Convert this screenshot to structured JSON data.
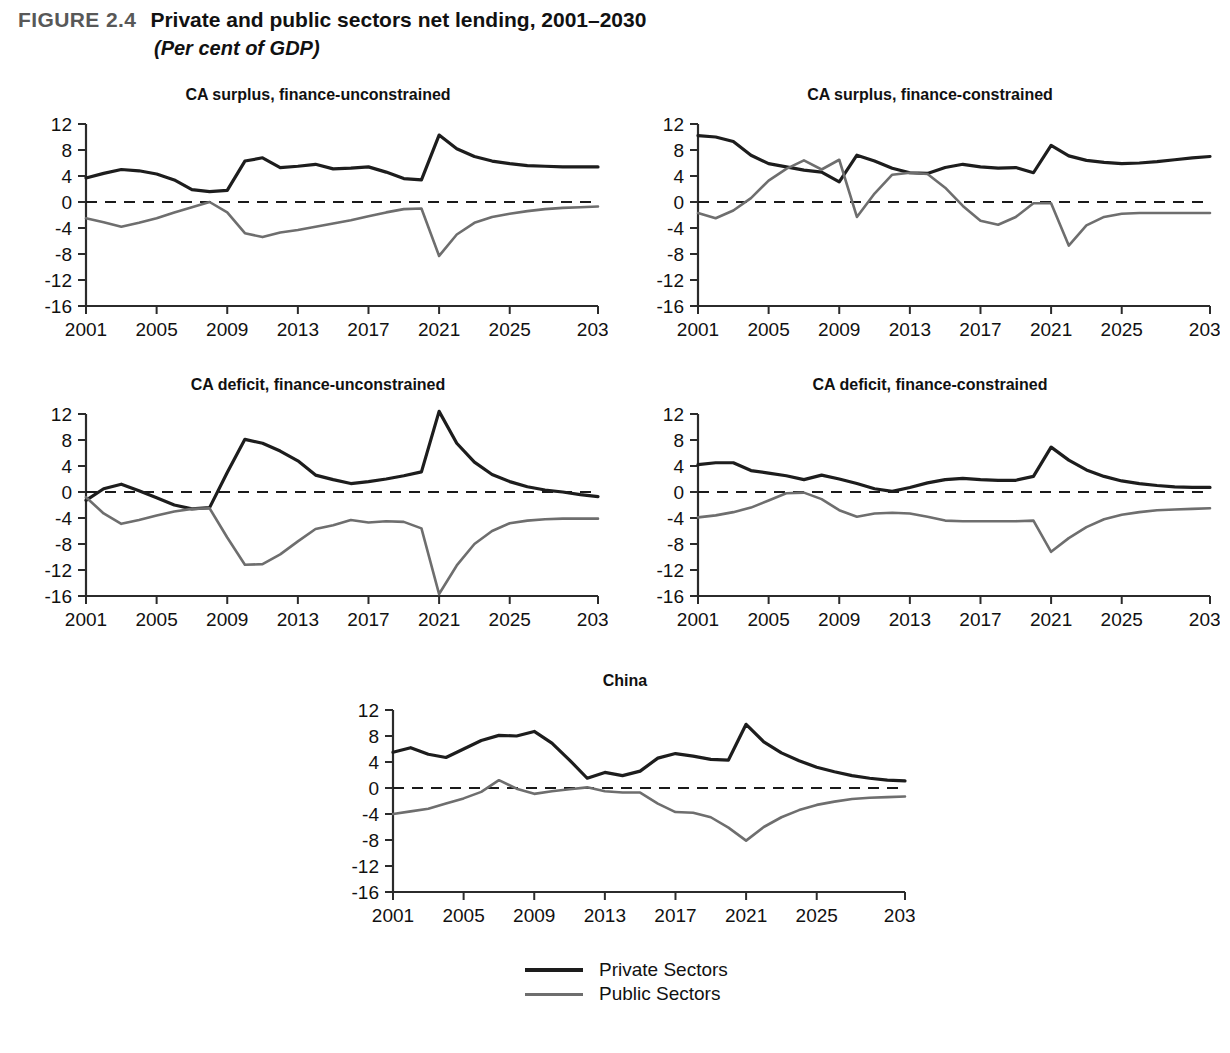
{
  "figure": {
    "label": "FIGURE 2.4",
    "title": "Private and public sectors net lending, 2001–2030",
    "subtitle": "(Per cent of GDP)"
  },
  "legend": {
    "position": "bottom-center",
    "entries": [
      {
        "label": "Private Sectors",
        "color": "#1d1d1d"
      },
      {
        "label": "Public Sectors",
        "color": "#6e6e6e"
      }
    ]
  },
  "axes_common": {
    "ylim": [
      -16,
      12
    ],
    "yticks": [
      12,
      8,
      4,
      0,
      -4,
      -8,
      -12,
      -16
    ],
    "ytick_labels": [
      "12",
      "8",
      "4",
      "0",
      "-4",
      "-8",
      "-12",
      "-16"
    ],
    "xlim": [
      2001,
      2030
    ],
    "xticks": [
      2001,
      2005,
      2009,
      2013,
      2017,
      2021,
      2025,
      2030
    ],
    "xtick_labels": [
      "2001",
      "2005",
      "2009",
      "2013",
      "2017",
      "2021",
      "2025",
      "2030"
    ],
    "grid": false,
    "zero_reference_line": true
  },
  "chart_data": [
    {
      "id": "ca-surplus-finance-unconstrained",
      "type": "line",
      "title": "CA surplus, finance-unconstrained",
      "xlabel": "",
      "ylabel": "",
      "ylim": [
        -16,
        12
      ],
      "xlim": [
        2001,
        2030
      ],
      "x": [
        2001,
        2002,
        2003,
        2004,
        2005,
        2006,
        2007,
        2008,
        2009,
        2010,
        2011,
        2012,
        2013,
        2014,
        2015,
        2016,
        2017,
        2018,
        2019,
        2020,
        2021,
        2022,
        2023,
        2024,
        2025,
        2026,
        2027,
        2028,
        2029,
        2030
      ],
      "series": [
        {
          "name": "Private Sectors",
          "color": "#1d1d1d",
          "values": [
            3.7,
            4.4,
            5.0,
            4.8,
            4.3,
            3.4,
            1.9,
            1.6,
            1.8,
            6.3,
            6.8,
            5.3,
            5.5,
            5.8,
            5.1,
            5.2,
            5.4,
            4.6,
            3.6,
            3.4,
            10.3,
            8.2,
            7.0,
            6.3,
            5.9,
            5.6,
            5.5,
            5.4,
            5.4,
            5.4
          ]
        },
        {
          "name": "Public Sectors",
          "color": "#6e6e6e",
          "values": [
            -2.5,
            -3.1,
            -3.8,
            -3.2,
            -2.5,
            -1.6,
            -0.8,
            0.0,
            -1.6,
            -4.8,
            -5.4,
            -4.7,
            -4.3,
            -3.8,
            -3.3,
            -2.8,
            -2.2,
            -1.6,
            -1.1,
            -1.0,
            -8.3,
            -5.0,
            -3.2,
            -2.3,
            -1.8,
            -1.4,
            -1.1,
            -0.9,
            -0.8,
            -0.7
          ]
        }
      ]
    },
    {
      "id": "ca-surplus-finance-constrained",
      "type": "line",
      "title": "CA surplus, finance-constrained",
      "xlabel": "",
      "ylabel": "",
      "ylim": [
        -16,
        12
      ],
      "xlim": [
        2001,
        2030
      ],
      "x": [
        2001,
        2002,
        2003,
        2004,
        2005,
        2006,
        2007,
        2008,
        2009,
        2010,
        2011,
        2012,
        2013,
        2014,
        2015,
        2016,
        2017,
        2018,
        2019,
        2020,
        2021,
        2022,
        2023,
        2024,
        2025,
        2026,
        2027,
        2028,
        2029,
        2030
      ],
      "series": [
        {
          "name": "Private Sectors",
          "color": "#1d1d1d",
          "values": [
            10.2,
            10.0,
            9.3,
            7.2,
            5.9,
            5.4,
            4.9,
            4.6,
            3.1,
            7.2,
            6.3,
            5.2,
            4.5,
            4.4,
            5.3,
            5.8,
            5.4,
            5.2,
            5.3,
            4.5,
            8.7,
            7.1,
            6.4,
            6.1,
            5.9,
            6.0,
            6.2,
            6.5,
            6.8,
            7.0
          ]
        },
        {
          "name": "Public Sectors",
          "color": "#6e6e6e",
          "values": [
            -1.7,
            -2.5,
            -1.3,
            0.6,
            3.3,
            5.1,
            6.4,
            5.0,
            6.5,
            -2.3,
            1.3,
            4.2,
            4.5,
            4.3,
            2.2,
            -0.6,
            -2.9,
            -3.5,
            -2.3,
            -0.2,
            -0.2,
            -6.7,
            -3.6,
            -2.3,
            -1.8,
            -1.7,
            -1.7,
            -1.7,
            -1.7,
            -1.7
          ]
        }
      ]
    },
    {
      "id": "ca-deficit-finance-unconstrained",
      "type": "line",
      "title": "CA deficit, finance-unconstrained",
      "xlabel": "",
      "ylabel": "",
      "ylim": [
        -16,
        12
      ],
      "xlim": [
        2001,
        2030
      ],
      "x": [
        2001,
        2002,
        2003,
        2004,
        2005,
        2006,
        2007,
        2008,
        2009,
        2010,
        2011,
        2012,
        2013,
        2014,
        2015,
        2016,
        2017,
        2018,
        2019,
        2020,
        2021,
        2022,
        2023,
        2024,
        2025,
        2026,
        2027,
        2028,
        2029,
        2030
      ],
      "series": [
        {
          "name": "Private Sectors",
          "color": "#1d1d1d",
          "values": [
            -1.3,
            0.5,
            1.2,
            0.2,
            -0.9,
            -2.0,
            -2.6,
            -2.4,
            3.0,
            8.1,
            7.5,
            6.3,
            4.8,
            2.6,
            1.9,
            1.3,
            1.6,
            2.0,
            2.5,
            3.1,
            12.4,
            7.5,
            4.6,
            2.7,
            1.6,
            0.8,
            0.3,
            0.0,
            -0.4,
            -0.7
          ]
        },
        {
          "name": "Public Sectors",
          "color": "#6e6e6e",
          "values": [
            -0.8,
            -3.3,
            -4.9,
            -4.3,
            -3.6,
            -3.0,
            -2.6,
            -2.5,
            -7.0,
            -11.2,
            -11.1,
            -9.6,
            -7.6,
            -5.7,
            -5.1,
            -4.3,
            -4.7,
            -4.5,
            -4.6,
            -5.6,
            -15.7,
            -11.3,
            -8.0,
            -6.0,
            -4.8,
            -4.4,
            -4.2,
            -4.1,
            -4.1,
            -4.1
          ]
        }
      ]
    },
    {
      "id": "ca-deficit-finance-constrained",
      "type": "line",
      "title": "CA deficit, finance-constrained",
      "xlabel": "",
      "ylabel": "",
      "ylim": [
        -16,
        12
      ],
      "xlim": [
        2001,
        2030
      ],
      "x": [
        2001,
        2002,
        2003,
        2004,
        2005,
        2006,
        2007,
        2008,
        2009,
        2010,
        2011,
        2012,
        2013,
        2014,
        2015,
        2016,
        2017,
        2018,
        2019,
        2020,
        2021,
        2022,
        2023,
        2024,
        2025,
        2026,
        2027,
        2028,
        2029,
        2030
      ],
      "series": [
        {
          "name": "Private Sectors",
          "color": "#1d1d1d",
          "values": [
            4.2,
            4.5,
            4.5,
            3.3,
            2.9,
            2.5,
            1.9,
            2.6,
            2.0,
            1.3,
            0.5,
            0.1,
            0.7,
            1.4,
            1.9,
            2.1,
            1.9,
            1.8,
            1.8,
            2.4,
            6.9,
            4.9,
            3.4,
            2.4,
            1.7,
            1.3,
            1.0,
            0.8,
            0.7,
            0.7
          ]
        },
        {
          "name": "Public Sectors",
          "color": "#6e6e6e",
          "values": [
            -3.9,
            -3.6,
            -3.1,
            -2.4,
            -1.3,
            -0.2,
            -0.1,
            -1.1,
            -2.8,
            -3.8,
            -3.3,
            -3.2,
            -3.3,
            -3.8,
            -4.4,
            -4.5,
            -4.5,
            -4.5,
            -4.5,
            -4.4,
            -9.2,
            -7.1,
            -5.4,
            -4.2,
            -3.5,
            -3.1,
            -2.8,
            -2.7,
            -2.6,
            -2.5
          ]
        }
      ]
    },
    {
      "id": "china",
      "type": "line",
      "title": "China",
      "xlabel": "",
      "ylabel": "",
      "ylim": [
        -16,
        12
      ],
      "xlim": [
        2001,
        2030
      ],
      "x": [
        2001,
        2002,
        2003,
        2004,
        2005,
        2006,
        2007,
        2008,
        2009,
        2010,
        2011,
        2012,
        2013,
        2014,
        2015,
        2016,
        2017,
        2018,
        2019,
        2020,
        2021,
        2022,
        2023,
        2024,
        2025,
        2026,
        2027,
        2028,
        2029,
        2030
      ],
      "series": [
        {
          "name": "Private Sectors",
          "color": "#1d1d1d",
          "values": [
            5.5,
            6.2,
            5.2,
            4.7,
            6.0,
            7.3,
            8.1,
            8.0,
            8.7,
            6.9,
            4.3,
            1.5,
            2.4,
            1.9,
            2.6,
            4.6,
            5.3,
            4.9,
            4.4,
            4.3,
            9.8,
            7.1,
            5.4,
            4.2,
            3.2,
            2.5,
            1.9,
            1.5,
            1.2,
            1.1
          ]
        },
        {
          "name": "Public Sectors",
          "color": "#6e6e6e",
          "values": [
            -4.0,
            -3.6,
            -3.2,
            -2.4,
            -1.6,
            -0.6,
            1.2,
            -0.1,
            -0.9,
            -0.5,
            -0.2,
            0.1,
            -0.5,
            -0.7,
            -0.7,
            -2.4,
            -3.7,
            -3.8,
            -4.5,
            -6.1,
            -8.1,
            -6.0,
            -4.5,
            -3.4,
            -2.6,
            -2.1,
            -1.7,
            -1.5,
            -1.4,
            -1.3
          ]
        }
      ]
    }
  ]
}
